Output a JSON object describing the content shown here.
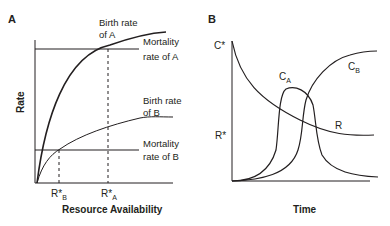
{
  "panel_a": {
    "letter": "A",
    "y_axis_label": "Rate",
    "x_axis_label": "Resource Availability",
    "birth_a_label_1": "Birth rate",
    "birth_a_label_2": "of A",
    "mort_a_label_1": "Mortality",
    "mort_a_label_2": "rate of A",
    "birth_b_label_1": "Birth rate",
    "birth_b_label_2": "of B",
    "mort_b_label_1": "Mortality",
    "mort_b_label_2": "rate of B",
    "tick_rb": "R*",
    "tick_rb_sub": "B",
    "tick_ra": "R*",
    "tick_ra_sub": "A"
  },
  "panel_b": {
    "letter": "B",
    "x_axis_label": "Time",
    "y_tick_c": "C*",
    "y_tick_r": "R*",
    "curve_ca": "C",
    "curve_ca_sub": "A",
    "curve_cb": "C",
    "curve_cb_sub": "B",
    "curve_r": "R"
  },
  "colors": {
    "ink": "#231f20",
    "background": "#ffffff"
  }
}
